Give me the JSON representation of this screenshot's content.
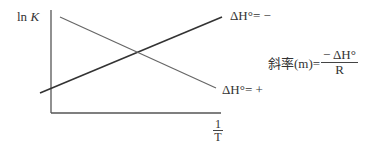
{
  "diagram": {
    "title": "",
    "y_axis_label": {
      "text": "ln ",
      "var": "K"
    },
    "x_axis_label": {
      "numerator": "1",
      "denominator": "T"
    },
    "lines": [
      {
        "label": "ΔH°= −",
        "direction": "increasing"
      },
      {
        "label": "ΔH°= +",
        "direction": "decreasing"
      }
    ],
    "slope_formula": {
      "prefix": "斜率(m)=",
      "numerator": "− ΔH°",
      "denominator": "R"
    },
    "colors": {
      "axis": "#555555",
      "line_increasing": "#333333",
      "line_decreasing": "#666666"
    }
  }
}
